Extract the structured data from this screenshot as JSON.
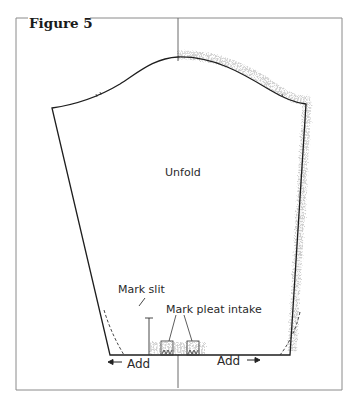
{
  "figure": {
    "title": "Figure 5",
    "labels": {
      "center": "Unfold",
      "slit": "Mark slit",
      "pleat": "Mark pleat intake",
      "add_left": "Add",
      "add_right": "Add"
    },
    "colors": {
      "outline": "#1e1e1e",
      "frame": "#8a8a8a",
      "fringe": "#9a9a9a"
    }
  }
}
